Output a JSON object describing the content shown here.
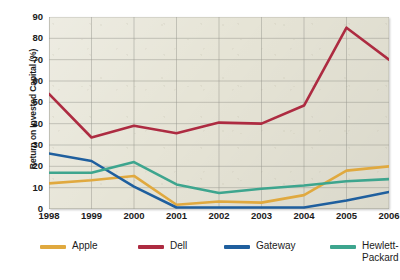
{
  "chart_data": {
    "type": "line",
    "title": "",
    "xlabel": "",
    "ylabel": "Return on Invested Capital (%)",
    "categories": [
      "1998",
      "1999",
      "2000",
      "2001",
      "2002",
      "2003",
      "2004",
      "2005",
      "2006"
    ],
    "x": [
      1998,
      1999,
      2000,
      2001,
      2002,
      2003,
      2004,
      2005,
      2006
    ],
    "ylim": [
      0,
      90
    ],
    "yticks": [
      0,
      10,
      20,
      30,
      40,
      50,
      60,
      70,
      80,
      90
    ],
    "grid": true,
    "legend_position": "bottom",
    "series": [
      {
        "name": "Apple",
        "color": "#e0a93f",
        "values": [
          12,
          13.5,
          15.5,
          2,
          3.5,
          3,
          6.5,
          18,
          20
        ]
      },
      {
        "name": "Dell",
        "color": "#ad2b41",
        "values": [
          54,
          33.5,
          39,
          35.5,
          40.5,
          40,
          48.5,
          85,
          70
        ]
      },
      {
        "name": "Gateway",
        "color": "#1f5f9e",
        "values": [
          26,
          22.5,
          10.5,
          0.7,
          0.7,
          0.7,
          0.7,
          4,
          8
        ]
      },
      {
        "name": "Hewlett-Packard",
        "color": "#3da58e",
        "values": [
          17,
          17,
          22,
          11.5,
          7.5,
          9.5,
          11,
          13,
          14
        ]
      }
    ]
  },
  "legend": {
    "items": [
      {
        "label": "Apple",
        "color": "#e0a93f"
      },
      {
        "label": "Dell",
        "color": "#ad2b41"
      },
      {
        "label": "Gateway",
        "color": "#1f5f9e"
      },
      {
        "label": "Hewlett-\nPackard",
        "color": "#3da58e"
      }
    ]
  },
  "style": {
    "plot_background": "#e6e4d6",
    "grid_color": "#9a9a90",
    "axis_color": "#6f6f68",
    "text_color": "#1b1b1b"
  }
}
